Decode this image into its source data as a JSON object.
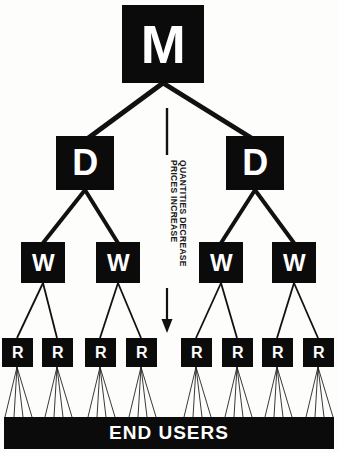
{
  "diagram": {
    "colors": {
      "node_fill": "#0b0b0b",
      "node_text": "#ffffff",
      "background": "#fdfdfb",
      "line": "#111111"
    },
    "levels": [
      {
        "id": "manufacturer",
        "label": "M",
        "count": 1
      },
      {
        "id": "distributor",
        "label": "D",
        "count": 2
      },
      {
        "id": "wholesaler",
        "label": "W",
        "count": 4
      },
      {
        "id": "retailer",
        "label": "R",
        "count": 8
      }
    ],
    "nodes": {
      "m": "M",
      "d": [
        "D",
        "D"
      ],
      "w": [
        "W",
        "W",
        "W",
        "W"
      ],
      "r": [
        "R",
        "R",
        "R",
        "R",
        "R",
        "R",
        "R",
        "R"
      ]
    },
    "end_bar": {
      "label": "END USERS"
    },
    "annotations": {
      "line_1": "PRICES INCREASE",
      "line_2": "QUANTITIES DECREASE",
      "direction_icon": "down-arrow-icon"
    }
  }
}
